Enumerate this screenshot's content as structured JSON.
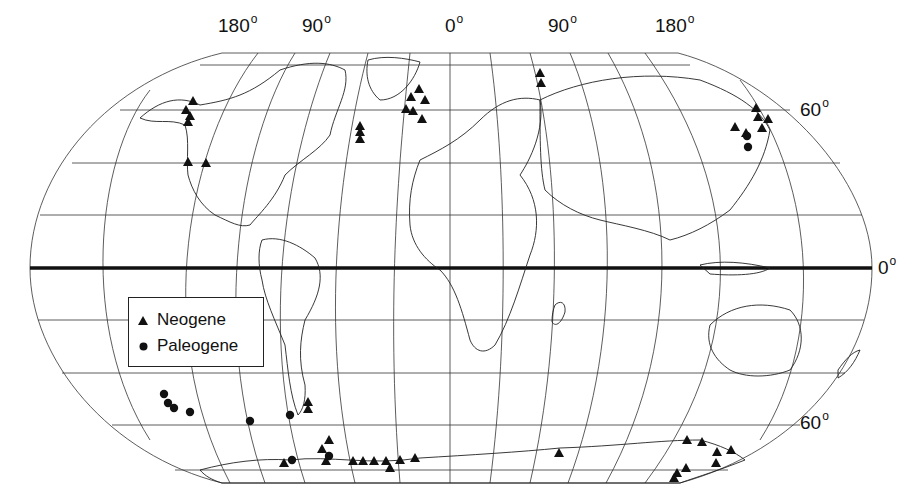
{
  "chart_data": {
    "type": "map",
    "title": "",
    "projection": "rotated global projection (oval outline) with graticule",
    "longitude_labels": [
      {
        "text": "180",
        "x": 218
      },
      {
        "text": "90",
        "x": 302
      },
      {
        "text": "0",
        "x": 445
      },
      {
        "text": "90",
        "x": 548
      },
      {
        "text": "180",
        "x": 655
      }
    ],
    "latitude_labels": [
      {
        "text": "60",
        "side": "right",
        "y": 112
      },
      {
        "text": "0",
        "side": "right",
        "y": 268
      },
      {
        "text": "60",
        "side": "right",
        "y": 465
      }
    ],
    "equator_emphasized": true,
    "legend": {
      "position": "lower-left inside map",
      "entries": [
        {
          "symbol": "triangle",
          "label": "Neogene"
        },
        {
          "symbol": "circle",
          "label": "Paleogene"
        }
      ]
    },
    "series": [
      {
        "name": "Neogene",
        "marker": "triangle",
        "color": "#111111",
        "points_px": [
          [
            193,
            101
          ],
          [
            186,
            110
          ],
          [
            190,
            116
          ],
          [
            188,
            122
          ],
          [
            188,
            162
          ],
          [
            206,
            163
          ],
          [
            360,
            126
          ],
          [
            360,
            132
          ],
          [
            360,
            139
          ],
          [
            419,
            89
          ],
          [
            411,
            97
          ],
          [
            425,
            100
          ],
          [
            406,
            109
          ],
          [
            413,
            111
          ],
          [
            422,
            119
          ],
          [
            540,
            73
          ],
          [
            541,
            83
          ],
          [
            756,
            108
          ],
          [
            758,
            117
          ],
          [
            768,
            119
          ],
          [
            762,
            128
          ],
          [
            735,
            127
          ],
          [
            746,
            133
          ],
          [
            308,
            402
          ],
          [
            308,
            409
          ],
          [
            329,
            440
          ],
          [
            322,
            449
          ],
          [
            326,
            461
          ],
          [
            284,
            463
          ],
          [
            353,
            461
          ],
          [
            363,
            461
          ],
          [
            374,
            461
          ],
          [
            386,
            461
          ],
          [
            400,
            460
          ],
          [
            415,
            458
          ],
          [
            390,
            468
          ],
          [
            559,
            453
          ],
          [
            687,
            440
          ],
          [
            702,
            442
          ],
          [
            717,
            452
          ],
          [
            731,
            450
          ],
          [
            716,
            463
          ],
          [
            686,
            468
          ],
          [
            677,
            473
          ],
          [
            674,
            478
          ]
        ]
      },
      {
        "name": "Paleogene",
        "marker": "circle",
        "color": "#111111",
        "points_px": [
          [
            164,
            394
          ],
          [
            168,
            403
          ],
          [
            174,
            408
          ],
          [
            190,
            412
          ],
          [
            250,
            421
          ],
          [
            290,
            415
          ],
          [
            329,
            456
          ],
          [
            292,
            460
          ],
          [
            747,
            136
          ],
          [
            748,
            147
          ]
        ]
      }
    ]
  },
  "legend": {
    "neogene_label": "Neogene",
    "paleogene_label": "Paleogene"
  },
  "labels": {
    "lon_180_left": "180",
    "lon_90_left": "90",
    "lon_0": "0",
    "lon_90_right": "90",
    "lon_180_right": "180",
    "lat_60_north": "60",
    "lat_0": "0",
    "lat_60_south": "60",
    "degree_symbol": "o"
  }
}
